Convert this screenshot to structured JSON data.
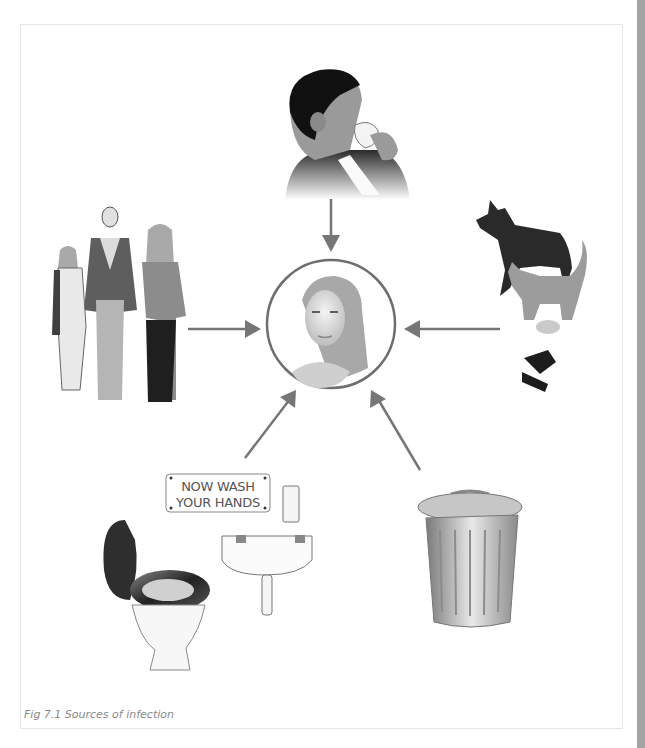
{
  "figure": {
    "caption": "Fig 7.1 Sources of infection",
    "center": {
      "label": "infected-person",
      "description": "woman's portrait in circle"
    },
    "sources": [
      {
        "id": "sneezing-person",
        "description": "man blowing nose into tissue",
        "position": "top"
      },
      {
        "id": "animals",
        "description": "dog, cat, mouse, fly and mosquito",
        "position": "right"
      },
      {
        "id": "waste-bin",
        "description": "metal dustbin with lid",
        "position": "bottom-right"
      },
      {
        "id": "toilet-and-sink",
        "description": "toilet, washbasin and soap dispenser",
        "position": "bottom-left"
      },
      {
        "id": "people",
        "description": "family of man, woman and child",
        "position": "left"
      }
    ],
    "sign": {
      "line1": "NOW WASH",
      "line2": "YOUR HANDS"
    },
    "colors": {
      "arrow": "#767676",
      "circle": "#6e6e6e",
      "sidebar": "#a4a4a4",
      "frame": "#e6e6e6",
      "caption": "#8a8a8a"
    }
  }
}
